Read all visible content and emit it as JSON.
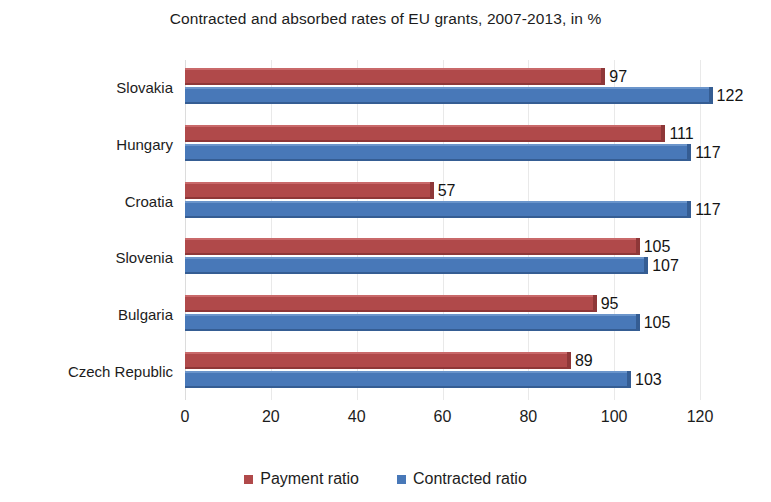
{
  "chart_data": {
    "type": "bar",
    "orientation": "horizontal",
    "title": "Contracted and absorbed rates of EU grants, 2007-2013, in %",
    "xlabel": "",
    "ylabel": "",
    "xlim": [
      0,
      120
    ],
    "xticks": [
      "0",
      "20",
      "40",
      "60",
      "80",
      "100",
      "120"
    ],
    "grid": true,
    "legend_position": "bottom",
    "categories": [
      "Slovakia",
      "Hungary",
      "Croatia",
      "Slovenia",
      "Bulgaria",
      "Czech Republic"
    ],
    "series": [
      {
        "name": "Payment ratio",
        "color": "#b0494a",
        "values": [
          97,
          111,
          57,
          105,
          95,
          89
        ]
      },
      {
        "name": "Contracted ratio",
        "color": "#4878b8",
        "values": [
          122,
          117,
          117,
          107,
          105,
          103
        ]
      }
    ]
  }
}
